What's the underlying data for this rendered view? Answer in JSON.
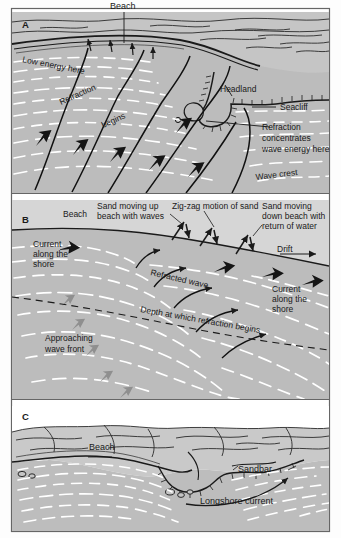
{
  "figure": {
    "title_visible": false,
    "panel_count": 3,
    "background_color": "#ffffff",
    "frame_color": "#555555",
    "water_color": "#b9b9b9",
    "land_color": "#c9c9c9",
    "wave_line_color": "#ffffff",
    "ink_color": "#1a1a1a",
    "gray_arrow_color": "#8f8f8f"
  },
  "panels": [
    {
      "id": "A",
      "label": "A",
      "labels": [
        {
          "key": "beach",
          "text": "Beach"
        },
        {
          "key": "low_energy",
          "text": "Low energy here"
        },
        {
          "key": "refraction",
          "text": "Refraction"
        },
        {
          "key": "begins",
          "text": "begins"
        },
        {
          "key": "headland",
          "text": "Headland"
        },
        {
          "key": "seacliff",
          "text": "Seacliff"
        },
        {
          "key": "concentrates_1",
          "text": "Refraction"
        },
        {
          "key": "concentrates_2",
          "text": "concentrates"
        },
        {
          "key": "concentrates_3",
          "text": "wave energy here"
        },
        {
          "key": "wave_crest",
          "text": "Wave crest"
        }
      ]
    },
    {
      "id": "B",
      "label": "B",
      "labels": [
        {
          "key": "beach",
          "text": "Beach"
        },
        {
          "key": "sand_up_1",
          "text": "Sand moving up"
        },
        {
          "key": "sand_up_2",
          "text": "beach with waves"
        },
        {
          "key": "zigzag",
          "text": "Zig-zag motion of sand"
        },
        {
          "key": "sand_down_1",
          "text": "Sand moving"
        },
        {
          "key": "sand_down_2",
          "text": "down beach with"
        },
        {
          "key": "sand_down_3",
          "text": "return of water"
        },
        {
          "key": "drift",
          "text": "Drift"
        },
        {
          "key": "current_left_1",
          "text": "Current"
        },
        {
          "key": "current_left_2",
          "text": "along the"
        },
        {
          "key": "current_left_3",
          "text": "shore"
        },
        {
          "key": "current_right_1",
          "text": "Current"
        },
        {
          "key": "current_right_2",
          "text": "along the"
        },
        {
          "key": "current_right_3",
          "text": "shore"
        },
        {
          "key": "refracted_wave",
          "text": "Refracted wave"
        },
        {
          "key": "depth_line",
          "text": "Depth at which refraction begins"
        },
        {
          "key": "approaching_1",
          "text": "Approaching"
        },
        {
          "key": "approaching_2",
          "text": "wave front"
        }
      ]
    },
    {
      "id": "C",
      "label": "C",
      "labels": [
        {
          "key": "beach",
          "text": "Beach"
        },
        {
          "key": "sandbar",
          "text": "Sandbar"
        },
        {
          "key": "longshore",
          "text": "Longshore current"
        }
      ]
    }
  ]
}
